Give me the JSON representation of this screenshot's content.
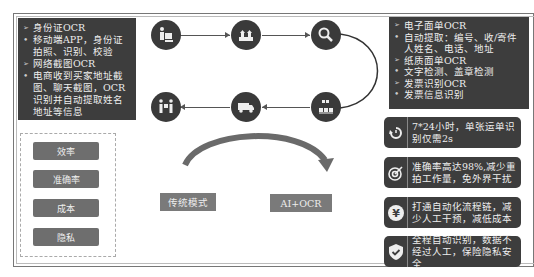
{
  "left_panel": {
    "items": [
      {
        "type": "heading",
        "marker": "➢",
        "text": "身份证OCR"
      },
      {
        "type": "bullet",
        "marker": "•",
        "text": "移动端APP，身份证拍照、识别、校验"
      },
      {
        "type": "heading",
        "marker": "➢",
        "text": "网络截图OCR"
      },
      {
        "type": "bullet",
        "marker": "•",
        "text": "电商收到买家地址截图、聊天截图，OCR识别并自动提取姓名地址等信息"
      }
    ]
  },
  "criteria": [
    "效率",
    "准确率",
    "成本",
    "隐私"
  ],
  "flow": {
    "nodes": [
      "worker-packing-icon",
      "warehouse-icon",
      "search-icon",
      "sorting-icon",
      "truck-icon",
      "delivery-handover-icon"
    ]
  },
  "modes": {
    "traditional": "传统模式",
    "ai": "AI+OCR"
  },
  "right_panel": {
    "items": [
      {
        "type": "heading",
        "marker": "➢",
        "text": "电子面单OCR"
      },
      {
        "type": "bullet",
        "marker": "•",
        "text": "自动提取：编号、收/寄件人姓名、电话、地址"
      },
      {
        "type": "heading",
        "marker": "➢",
        "text": "纸质面单OCR"
      },
      {
        "type": "bullet",
        "marker": "•",
        "text": "文字检测、盖章检测"
      },
      {
        "type": "heading",
        "marker": "➢",
        "text": "发票识别OCR"
      },
      {
        "type": "bullet",
        "marker": "•",
        "text": "发票信息识别"
      }
    ]
  },
  "features": [
    {
      "icon": "clock-24h-icon",
      "text": "7*24小时，单张运单识别仅需2s"
    },
    {
      "icon": "target-icon",
      "text": "准确率高达98%,减少重拍工作量，免外界干扰"
    },
    {
      "icon": "yen-icon",
      "text": "打通自动化流程链，减少人工干预，减低成本"
    },
    {
      "icon": "shield-check-icon",
      "text": "全程自动识别，数据不经过人工，保险隐私安全"
    }
  ],
  "colors": {
    "dark_panel": "#3d3d3d",
    "gray_button": "#6e6e6e",
    "mode_button": "#7a7a7a",
    "arrow": "#666666"
  }
}
